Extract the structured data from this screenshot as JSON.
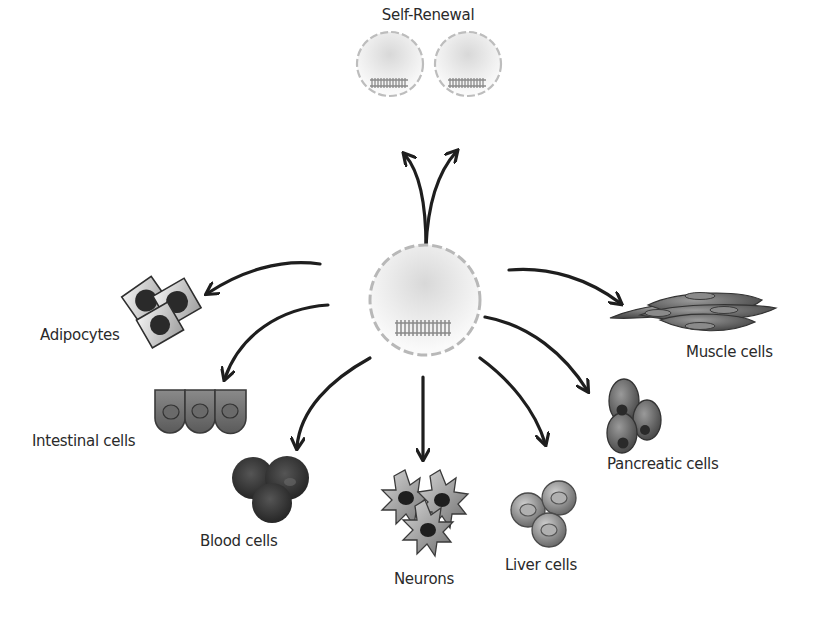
{
  "diagram": {
    "type": "stem-cell-differentiation",
    "center": {
      "name": "stem-cell"
    },
    "self_renewal": {
      "label": "Self-Renewal",
      "daughter_cells": 2
    },
    "differentiated": [
      {
        "id": "adipocytes",
        "label": "Adipocytes"
      },
      {
        "id": "intestinal",
        "label": "Intestinal cells"
      },
      {
        "id": "blood",
        "label": "Blood cells"
      },
      {
        "id": "neurons",
        "label": "Neurons"
      },
      {
        "id": "liver",
        "label": "Liver cells"
      },
      {
        "id": "pancreatic",
        "label": "Pancreatic cells"
      },
      {
        "id": "muscle",
        "label": "Muscle cells"
      }
    ],
    "colors": {
      "arrow": "#1e1e1e",
      "membrane": "#b8b8b8",
      "cell_fill": "#e4e4e4",
      "dark_cell": "#3c3c3c",
      "mid_cell": "#7a7a7a",
      "text": "#2a2a2a"
    }
  }
}
